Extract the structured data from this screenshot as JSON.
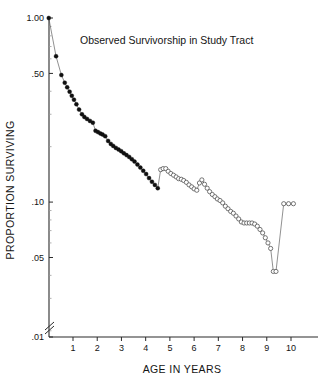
{
  "chart_data": {
    "type": "line",
    "title": "Observed Survivorship in Study Tract",
    "xlabel": "AGE IN YEARS",
    "ylabel": "PROPORTION SURVIVING",
    "yscale": "log",
    "ylim": [
      0.01,
      1.0
    ],
    "xlim": [
      0,
      10.8
    ],
    "grid": false,
    "legend": null,
    "y_tick_labels": [
      "1.00",
      ".50",
      ".10",
      ".05",
      ".01"
    ],
    "y_tick_values": [
      1.0,
      0.5,
      0.1,
      0.05,
      0.01
    ],
    "x_tick_labels": [
      "1",
      "2",
      "3",
      "4",
      "5",
      "6",
      "7",
      "8",
      "9",
      "10"
    ],
    "x_tick_values": [
      1,
      2,
      3,
      4,
      5,
      6,
      7,
      8,
      9,
      10
    ],
    "axis_break": {
      "axis": "y",
      "near_value": 0.01,
      "symbol": "double-slash"
    },
    "series": [
      {
        "name": "Observed survivorship (juvenile segment)",
        "marker": "filled-circle",
        "x": [
          0.0,
          0.3,
          0.52,
          0.66,
          0.76,
          0.86,
          0.95,
          1.04,
          1.14,
          1.25,
          1.37,
          1.47,
          1.58,
          1.7,
          1.82,
          1.93,
          2.03,
          2.13,
          2.22,
          2.33,
          2.45,
          2.56,
          2.66,
          2.77,
          2.88,
          2.99,
          3.1,
          3.21,
          3.32,
          3.43,
          3.54,
          3.66,
          3.78,
          3.9,
          4.02,
          4.14,
          4.26,
          4.38,
          4.5
        ],
        "y": [
          1.0,
          0.62,
          0.49,
          0.445,
          0.42,
          0.398,
          0.378,
          0.36,
          0.34,
          0.318,
          0.3,
          0.29,
          0.283,
          0.276,
          0.27,
          0.244,
          0.24,
          0.236,
          0.233,
          0.228,
          0.215,
          0.207,
          0.202,
          0.197,
          0.193,
          0.189,
          0.184,
          0.18,
          0.176,
          0.171,
          0.166,
          0.16,
          0.154,
          0.148,
          0.142,
          0.135,
          0.129,
          0.124,
          0.119
        ]
      },
      {
        "name": "Observed survivorship (adult segment)",
        "marker": "open-circle",
        "x": [
          4.62,
          4.72,
          4.83,
          4.93,
          5.04,
          5.15,
          5.26,
          5.36,
          5.47,
          5.57,
          5.68,
          5.79,
          5.9,
          6.0,
          6.11,
          6.22,
          6.32,
          6.43,
          6.54,
          6.64,
          6.75,
          6.86,
          6.96,
          7.07,
          7.18,
          7.29,
          7.4,
          7.51,
          7.62,
          7.73,
          7.84,
          7.95,
          8.06,
          8.17,
          8.28,
          8.39,
          8.5,
          8.61,
          8.72,
          8.83,
          8.94,
          9.05,
          9.16,
          9.27,
          9.38,
          9.7,
          9.9,
          10.1
        ],
        "y": [
          0.15,
          0.152,
          0.152,
          0.147,
          0.143,
          0.14,
          0.137,
          0.134,
          0.133,
          0.131,
          0.128,
          0.124,
          0.121,
          0.118,
          0.116,
          0.127,
          0.132,
          0.125,
          0.119,
          0.114,
          0.11,
          0.107,
          0.104,
          0.102,
          0.099,
          0.095,
          0.092,
          0.089,
          0.087,
          0.084,
          0.081,
          0.078,
          0.077,
          0.077,
          0.077,
          0.077,
          0.076,
          0.074,
          0.071,
          0.068,
          0.064,
          0.06,
          0.056,
          0.042,
          0.042,
          0.098,
          0.098,
          0.098
        ]
      }
    ]
  }
}
